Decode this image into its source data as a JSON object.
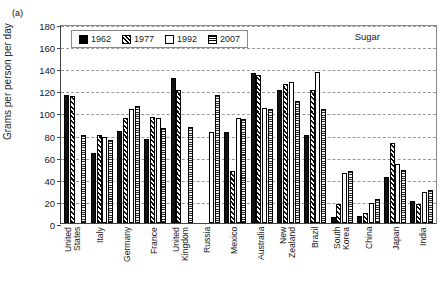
{
  "panel": {
    "label": "(a)"
  },
  "chart_data": {
    "type": "bar",
    "title": "Sugar",
    "xlabel": "",
    "ylabel": "Grams per person per day",
    "ylim": [
      0,
      180
    ],
    "ytick_step": 20,
    "yticks": [
      0,
      20,
      40,
      60,
      80,
      100,
      120,
      140,
      160,
      180
    ],
    "grid": true,
    "legend_position": "top-left",
    "categories": [
      "United\nStates",
      "Italy",
      "Germany",
      "France",
      "United\nKingdom",
      "Russia",
      "Mexico",
      "Australia",
      "New\nZealand",
      "Brazil",
      "South\nKorea",
      "China",
      "Japan",
      "India"
    ],
    "series": [
      {
        "name": "1962",
        "fill": "solid-black",
        "values": [
          116,
          63,
          83,
          76,
          131,
          null,
          82,
          136,
          120,
          80,
          5,
          6,
          42,
          20
        ]
      },
      {
        "name": "1977",
        "fill": "diagonal-hatch",
        "values": [
          115,
          80,
          95,
          96,
          120,
          null,
          47,
          134,
          126,
          120,
          17,
          9,
          72,
          17
        ]
      },
      {
        "name": "1992",
        "fill": "white",
        "values": [
          null,
          78,
          103,
          95,
          null,
          82,
          95,
          104,
          128,
          137,
          45,
          18,
          53,
          28
        ]
      },
      {
        "name": "2007",
        "fill": "horizontal-lines",
        "values": [
          80,
          75,
          106,
          86,
          87,
          116,
          94,
          103,
          110,
          103,
          47,
          22,
          48,
          30
        ]
      }
    ]
  }
}
